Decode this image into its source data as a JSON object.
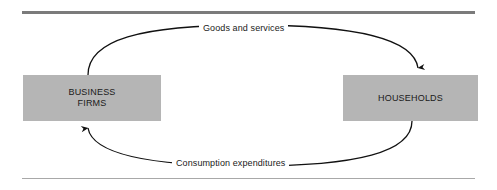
{
  "figure": {
    "background_color": "#ffffff",
    "width": 497,
    "height": 190
  },
  "rules": {
    "top": {
      "name": "top-rule",
      "color": "#7b7b7b",
      "thickness": "3px"
    },
    "bottom": {
      "name": "bottom-rule",
      "color": "#a8a8a8",
      "thickness": "1px"
    }
  },
  "nodes": [
    {
      "id": "business-firms",
      "label": "BUSINESS\nFIRMS",
      "fill_color": "#b5b5b5",
      "text_color": "#1a1a1a"
    },
    {
      "id": "households",
      "label": "HOUSEHOLDS",
      "fill_color": "#b5b5b5",
      "text_color": "#1a1a1a"
    }
  ],
  "flows": [
    {
      "id": "goods-and-services",
      "label": "Goods and services",
      "from": "business-firms",
      "to": "households",
      "direction": "clockwise-top",
      "arrow_color": "#111111"
    },
    {
      "id": "consumption-expenditures",
      "label": "Consumption expenditures",
      "from": "households",
      "to": "business-firms",
      "direction": "clockwise-bottom",
      "arrow_color": "#111111"
    }
  ]
}
